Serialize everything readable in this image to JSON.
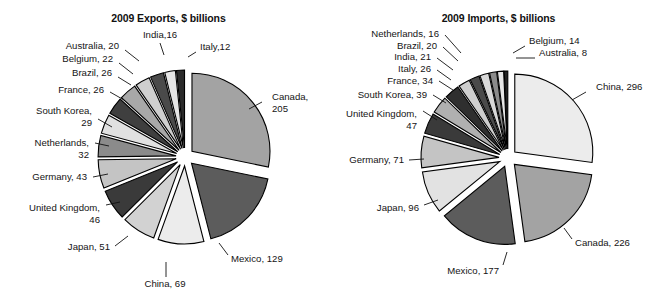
{
  "page": {
    "background": "#ffffff",
    "width": 654,
    "height": 305,
    "text_color": "#141414"
  },
  "charts": [
    {
      "id": "exports",
      "title": "2009 Exports, $ billions",
      "center": {
        "x": 185,
        "y": 157
      },
      "radius": 78,
      "explode": 9,
      "start_angle": -90,
      "chart_data": {
        "type": "pie",
        "title": "2009 Exports, $ billions",
        "unit": "$ billions",
        "year": 2009,
        "total": 665,
        "labels": [
          "Canada, 205",
          "Mexico, 129",
          "China, 69",
          "Japan, 51",
          "United Kingdom, 46",
          "Germany, 43",
          "Netherlands, 32",
          "South Korea, 29",
          "France, 26",
          "Brazil, 26",
          "Belgium, 22",
          "Australia, 20",
          "India,16",
          "Italy,12"
        ],
        "categories": [
          "Canada",
          "Mexico",
          "China",
          "Japan",
          "United Kingdom",
          "Germany",
          "Netherlands",
          "South Korea",
          "France",
          "Brazil",
          "Belgium",
          "Australia",
          "India",
          "Italy"
        ],
        "values": [
          205,
          129,
          69,
          51,
          46,
          43,
          32,
          29,
          26,
          26,
          22,
          20,
          16,
          12
        ],
        "colors": [
          "#a3a3a3",
          "#5c5c5c",
          "#ececec",
          "#d2d2d2",
          "#3a3a3a",
          "#c4c4c4",
          "#8b8b8b",
          "#e0e0e0",
          "#3f3f3f",
          "#a8a8a8",
          "#cfcfcf",
          "#4a4a4a",
          "#e6e6e6",
          "#2b2b2b"
        ],
        "label_anchors": [
          "start",
          "start",
          "middle",
          "end",
          "end",
          "end",
          "end",
          "end",
          "end",
          "end",
          "end",
          "end",
          "middle",
          "start"
        ],
        "label_positions": [
          {
            "x": 272,
            "y": 100
          },
          {
            "x": 231,
            "y": 262
          },
          {
            "x": 165,
            "y": 287
          },
          {
            "x": 110,
            "y": 250
          },
          {
            "x": 100,
            "y": 211
          },
          {
            "x": 87,
            "y": 180
          },
          {
            "x": 89,
            "y": 146
          },
          {
            "x": 92,
            "y": 114
          },
          {
            "x": 104,
            "y": 93
          },
          {
            "x": 112,
            "y": 76
          },
          {
            "x": 113,
            "y": 62
          },
          {
            "x": 119,
            "y": 49
          },
          {
            "x": 160,
            "y": 38
          },
          {
            "x": 200,
            "y": 50
          }
        ],
        "label_lines": [
          [
            "Canada,",
            "205"
          ],
          [
            "Mexico, 129"
          ],
          [
            "China, 69"
          ],
          [
            "Japan, 51"
          ],
          [
            "United Kingdom,",
            "46"
          ],
          [
            "Germany, 43"
          ],
          [
            "Netherlands,",
            "32"
          ],
          [
            "South Korea,",
            "29"
          ],
          [
            "France, 26"
          ],
          [
            "Brazil, 26"
          ],
          [
            "Belgium, 22"
          ],
          [
            "Australia, 20"
          ],
          [
            "India,16"
          ],
          [
            "Italy,12"
          ]
        ],
        "leaders": [
          [
            [
              262,
              102
            ],
            [
              249,
              109
            ]
          ],
          [
            [
              228,
              255
            ],
            [
              219,
              243
            ]
          ],
          [
            [
              166,
              277
            ],
            [
              166,
              262
            ]
          ],
          [
            [
              115,
              246
            ],
            [
              128,
              236
            ]
          ],
          [
            [
              106,
              205
            ],
            [
              120,
              202
            ]
          ],
          [
            [
              93,
              177
            ],
            [
              108,
              174
            ]
          ],
          [
            [
              95,
              143
            ],
            [
              109,
              146
            ]
          ],
          [
            [
              98,
              119
            ],
            [
              112,
              127
            ]
          ],
          [
            [
              110,
              92
            ],
            [
              124,
              100
            ]
          ],
          [
            [
              118,
              77
            ],
            [
              131,
              85
            ]
          ],
          [
            [
              119,
              63
            ],
            [
              133,
              74
            ]
          ],
          [
            [
              125,
              50
            ],
            [
              139,
              61
            ]
          ],
          [
            [
              160,
              43
            ],
            [
              164,
              55
            ]
          ],
          [
            [
              196,
              52
            ],
            [
              188,
              57
            ]
          ]
        ]
      }
    },
    {
      "id": "imports",
      "title": "2009 Imports, $ billions",
      "center": {
        "x": 181,
        "y": 158
      },
      "radius": 78,
      "explode": 9,
      "start_angle": -90,
      "chart_data": {
        "type": "pie",
        "title": "2009 Imports, $ billions",
        "unit": "$ billions",
        "year": 2009,
        "total": 1061,
        "labels": [
          "China, 296",
          "Canada, 226",
          "Mexico, 177",
          "Japan, 96",
          "Germany, 71",
          "United Kingdom, 47",
          "South Korea, 39",
          "France, 34",
          "Italy, 26",
          "India, 21",
          "Brazil, 20",
          "Netherlands, 16",
          "Belgium, 14",
          "Australia, 8"
        ],
        "categories": [
          "China",
          "Canada",
          "Mexico",
          "Japan",
          "Germany",
          "United Kingdom",
          "South Korea",
          "France",
          "Italy",
          "India",
          "Brazil",
          "Netherlands",
          "Belgium",
          "Australia"
        ],
        "values": [
          296,
          226,
          177,
          96,
          71,
          47,
          39,
          34,
          26,
          21,
          20,
          16,
          14,
          8
        ],
        "colors": [
          "#ececec",
          "#a3a3a3",
          "#5c5c5c",
          "#e2e2e2",
          "#c4c4c4",
          "#3a3a3a",
          "#b0b0b0",
          "#2f2f2f",
          "#cfcfcf",
          "#4a4a4a",
          "#d8d8d8",
          "#8b8b8b",
          "#e6e6e6",
          "#232323"
        ],
        "label_anchors": [
          "start",
          "start",
          "end",
          "end",
          "end",
          "end",
          "end",
          "end",
          "end",
          "end",
          "end",
          "end",
          "start",
          "start"
        ],
        "label_positions": [
          {
            "x": 269,
            "y": 90
          },
          {
            "x": 248,
            "y": 246
          },
          {
            "x": 172,
            "y": 274
          },
          {
            "x": 92,
            "y": 211
          },
          {
            "x": 77,
            "y": 163
          },
          {
            "x": 90,
            "y": 117
          },
          {
            "x": 100,
            "y": 98
          },
          {
            "x": 106,
            "y": 84
          },
          {
            "x": 104,
            "y": 72
          },
          {
            "x": 104,
            "y": 60
          },
          {
            "x": 110,
            "y": 49
          },
          {
            "x": 112,
            "y": 37
          },
          {
            "x": 202,
            "y": 44
          },
          {
            "x": 212,
            "y": 56
          }
        ],
        "label_lines": [
          [
            "China, 296"
          ],
          [
            "Canada, 226"
          ],
          [
            "Mexico, 177"
          ],
          [
            "Japan, 96"
          ],
          [
            "Germany, 71"
          ],
          [
            "United Kingdom,",
            "47"
          ],
          [
            "South Korea, 39"
          ],
          [
            "France, 34"
          ],
          [
            "Italy, 26"
          ],
          [
            "India, 21"
          ],
          [
            "Brazil, 20"
          ],
          [
            "Netherlands, 16"
          ],
          [
            "Belgium, 14"
          ],
          [
            "Australia, 8"
          ]
        ],
        "leaders": [
          [
            [
              259,
              92
            ],
            [
              245,
              100
            ]
          ],
          [
            [
              245,
              239
            ],
            [
              237,
              228
            ]
          ],
          [
            [
              176,
              265
            ],
            [
              180,
              252
            ]
          ],
          [
            [
              97,
              205
            ],
            [
              111,
              200
            ]
          ],
          [
            [
              82,
              160
            ],
            [
              97,
              159
            ]
          ],
          [
            [
              96,
              111
            ],
            [
              110,
              120
            ]
          ],
          [
            [
              106,
              95
            ],
            [
              119,
              103
            ]
          ],
          [
            [
              112,
              81
            ],
            [
              126,
              90
            ]
          ],
          [
            [
              110,
              70
            ],
            [
              124,
              80
            ]
          ],
          [
            [
              110,
              58
            ],
            [
              126,
              70
            ]
          ],
          [
            [
              116,
              47
            ],
            [
              131,
              61
            ]
          ],
          [
            [
              118,
              35
            ],
            [
              134,
              53
            ]
          ],
          [
            [
              198,
              46
            ],
            [
              186,
              53
            ]
          ],
          [
            [
              208,
              58
            ],
            [
              189,
              58
            ]
          ]
        ]
      }
    }
  ]
}
